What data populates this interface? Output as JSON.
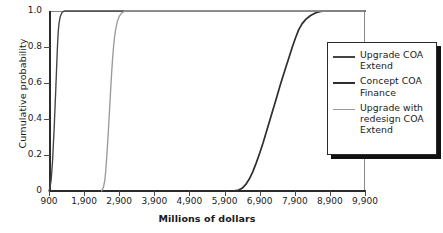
{
  "chart_data": {
    "type": "line",
    "title": "",
    "xlabel": "Millions of dollars",
    "ylabel": "Cumulative probability",
    "xlim": [
      900,
      9900
    ],
    "ylim": [
      0,
      1.0
    ],
    "xticks": [
      "900",
      "1,900",
      "2,900",
      "3,900",
      "4,900",
      "5,900",
      "6,900",
      "7,900",
      "8,900",
      "9,900"
    ],
    "xtick_values": [
      900,
      1900,
      2900,
      3900,
      4900,
      5900,
      6900,
      7900,
      8900,
      9900
    ],
    "yticks": [
      "0",
      "0.2",
      "0.4",
      "0.6",
      "0.8",
      "1.0"
    ],
    "ytick_values": [
      0,
      0.2,
      0.4,
      0.6,
      0.8,
      1.0
    ],
    "grid": false,
    "legend_position": "right",
    "series": [
      {
        "name": "Upgrade COA Extend",
        "color": "#444444",
        "width": 1.35,
        "points": [
          [
            900,
            0.0
          ],
          [
            930,
            0.02
          ],
          [
            960,
            0.06
          ],
          [
            985,
            0.12
          ],
          [
            1005,
            0.18
          ],
          [
            1020,
            0.24
          ],
          [
            1035,
            0.3
          ],
          [
            1050,
            0.36
          ],
          [
            1062,
            0.42
          ],
          [
            1075,
            0.48
          ],
          [
            1088,
            0.54
          ],
          [
            1100,
            0.6
          ],
          [
            1112,
            0.66
          ],
          [
            1124,
            0.72
          ],
          [
            1136,
            0.78
          ],
          [
            1150,
            0.84
          ],
          [
            1165,
            0.89
          ],
          [
            1185,
            0.93
          ],
          [
            1215,
            0.965
          ],
          [
            1265,
            0.99
          ],
          [
            1330,
            1.0
          ],
          [
            9900,
            1.0
          ]
        ]
      },
      {
        "name": "Concept COA Finance",
        "color": "#2e2e2e",
        "width": 1.7,
        "points": [
          [
            6150,
            0.0
          ],
          [
            6300,
            0.005
          ],
          [
            6400,
            0.015
          ],
          [
            6500,
            0.035
          ],
          [
            6600,
            0.065
          ],
          [
            6700,
            0.105
          ],
          [
            6800,
            0.155
          ],
          [
            6900,
            0.21
          ],
          [
            7000,
            0.27
          ],
          [
            7100,
            0.335
          ],
          [
            7200,
            0.4
          ],
          [
            7300,
            0.465
          ],
          [
            7400,
            0.53
          ],
          [
            7480,
            0.585
          ],
          [
            7560,
            0.635
          ],
          [
            7650,
            0.69
          ],
          [
            7740,
            0.745
          ],
          [
            7830,
            0.8
          ],
          [
            7920,
            0.85
          ],
          [
            8010,
            0.895
          ],
          [
            8110,
            0.93
          ],
          [
            8220,
            0.955
          ],
          [
            8350,
            0.975
          ],
          [
            8500,
            0.99
          ],
          [
            8700,
            1.0
          ],
          [
            9900,
            1.0
          ]
        ]
      },
      {
        "name": "Upgrade with redesign COA Extend",
        "color": "#9a9a9a",
        "width": 1.35,
        "points": [
          [
            2400,
            0.0
          ],
          [
            2450,
            0.02
          ],
          [
            2490,
            0.06
          ],
          [
            2520,
            0.12
          ],
          [
            2545,
            0.19
          ],
          [
            2568,
            0.26
          ],
          [
            2590,
            0.33
          ],
          [
            2610,
            0.4
          ],
          [
            2630,
            0.47
          ],
          [
            2650,
            0.54
          ],
          [
            2670,
            0.61
          ],
          [
            2692,
            0.68
          ],
          [
            2715,
            0.745
          ],
          [
            2740,
            0.805
          ],
          [
            2770,
            0.86
          ],
          [
            2805,
            0.905
          ],
          [
            2850,
            0.945
          ],
          [
            2905,
            0.972
          ],
          [
            2975,
            0.99
          ],
          [
            3060,
            1.0
          ],
          [
            9900,
            1.0
          ]
        ]
      }
    ]
  },
  "legend": {
    "entries": [
      {
        "label": "Upgrade COA Extend"
      },
      {
        "label": "Concept COA Finance"
      },
      {
        "label": "Upgrade with redesign COA Extend"
      }
    ]
  }
}
